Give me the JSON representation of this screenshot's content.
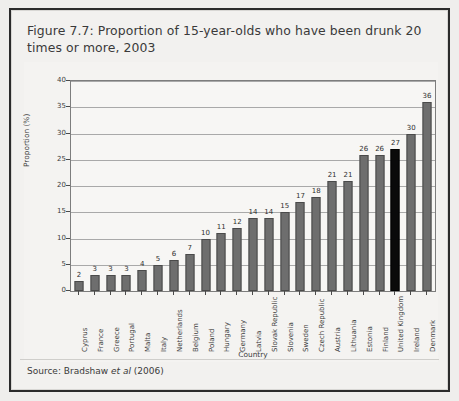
{
  "figure": {
    "title": "Figure 7.7: Proportion of 15-year-olds who have been drunk 20 times or more, 2003",
    "source_prefix": "Source: Bradshaw ",
    "source_italic": "et al",
    "source_suffix": " (2006)"
  },
  "colors": {
    "bar": "#6e6e6e",
    "bar_outline": "#4a4a4a",
    "highlight_bar": "#0a0a0a",
    "plot_background": "#f7f6f4",
    "panel_background": "#f4f3f1",
    "frame_border": "#2b2b2b",
    "gridline": "#a9a9a9",
    "text": "#3d3d3d"
  },
  "chart_data": {
    "type": "bar",
    "title": "Figure 7.7: Proportion of 15-year-olds who have been drunk 20 times or more, 2003",
    "xlabel": "Country",
    "ylabel": "Proportion (%)",
    "ylim": [
      0,
      40
    ],
    "ytick_values": [
      0,
      5,
      10,
      15,
      20,
      25,
      30,
      35,
      40
    ],
    "ytick_labels": [
      "0",
      "5",
      "10",
      "15",
      "20",
      "25",
      "30",
      "35",
      "40"
    ],
    "grid": true,
    "legend": "none",
    "highlight_category": "United Kingdom",
    "categories": [
      "Cyprus",
      "France",
      "Greece",
      "Portugal",
      "Malta",
      "Italy",
      "Netherlands",
      "Belgium",
      "Poland",
      "Hungary",
      "Germany",
      "Latvia",
      "Slovak Republic",
      "Slovenia",
      "Sweden",
      "Czech Republic",
      "Austria",
      "Lithuania",
      "Estonia",
      "Finland",
      "United Kingdom",
      "Ireland",
      "Denmark"
    ],
    "values": [
      2,
      3,
      3,
      3,
      4,
      5,
      6,
      7,
      10,
      11,
      12,
      14,
      14,
      15,
      17,
      18,
      21,
      21,
      26,
      26,
      27,
      30,
      36
    ],
    "data_labels": [
      "2",
      "3",
      "3",
      "3",
      "4",
      "5",
      "6",
      "7",
      "10",
      "11",
      "12",
      "14",
      "14",
      "15",
      "17",
      "18",
      "21",
      "21",
      "26",
      "26",
      "27",
      "30",
      "36"
    ]
  }
}
